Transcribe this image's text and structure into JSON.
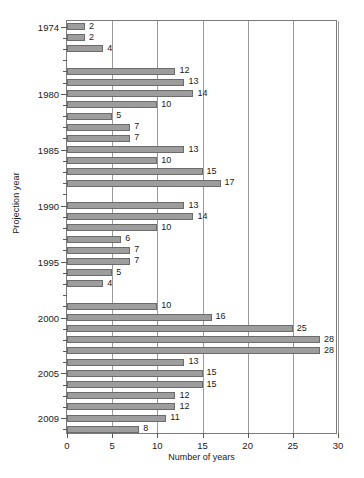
{
  "chart_data": {
    "type": "bar",
    "orientation": "horizontal",
    "title": "",
    "xlabel": "Number of years",
    "ylabel": "Projection year",
    "xlim": [
      0,
      30
    ],
    "xticks": [
      0,
      5,
      10,
      15,
      20,
      25,
      30
    ],
    "xtick_labels": [
      "0",
      "5",
      "10",
      "15",
      "20",
      "25",
      "30"
    ],
    "ytick_labels": [
      "1974",
      "1980",
      "1985",
      "1990",
      "1995",
      "2000",
      "2005",
      "2009"
    ],
    "grid": "vertical",
    "legend": "none",
    "bar_color": "#9d9d9d",
    "bar_edge_color": "#6b6b6b",
    "axis_color": "#7a7a7a",
    "gridline_color": "#9a9a9a",
    "categories": [
      "1974",
      "1975",
      "1976",
      "1977",
      "1978",
      "1979",
      "1980",
      "1981",
      "1982",
      "1983",
      "1984",
      "1985",
      "1986",
      "1987",
      "1988",
      "1989",
      "1990",
      "1991",
      "1992",
      "1993",
      "1994",
      "1995",
      "1996",
      "1997",
      "1998",
      "1999",
      "2000",
      "2001",
      "2002",
      "2003",
      "2004",
      "2005",
      "2006",
      "2007",
      "2008",
      "2009"
    ],
    "values": [
      2,
      2,
      4,
      0,
      12,
      13,
      14,
      10,
      5,
      7,
      7,
      13,
      10,
      15,
      17,
      0,
      13,
      14,
      10,
      6,
      7,
      7,
      5,
      4,
      0,
      10,
      16,
      25,
      28,
      28,
      13,
      15,
      15,
      12,
      12,
      11
    ],
    "value_labels": [
      "2",
      "2",
      "4",
      "",
      "12",
      "13",
      "14",
      "10",
      "5",
      "7",
      "7",
      "13",
      "10",
      "15",
      "17",
      "",
      "13",
      "14",
      "10",
      "6",
      "7",
      "7",
      "5",
      "4",
      "",
      "10",
      "16",
      "25",
      "28",
      "28",
      "13",
      "15",
      "15",
      "12",
      "12",
      "11"
    ],
    "extra_row": {
      "category": "2009b",
      "value": 8,
      "value_label": "8"
    }
  }
}
